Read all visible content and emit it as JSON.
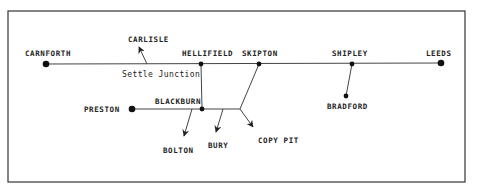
{
  "diagram": {
    "colors": {
      "line": "#444444",
      "frame": "#333333",
      "dot": "#111111",
      "text": "#222222"
    },
    "stations": [
      {
        "id": "carnforth",
        "label": "CARNFORTH",
        "x": 46,
        "y": 64
      },
      {
        "id": "hellifield",
        "label": "HELLIFIELD",
        "x": 201,
        "y": 64
      },
      {
        "id": "skipton",
        "label": "SKIPTON",
        "x": 259,
        "y": 64
      },
      {
        "id": "shipley",
        "label": "SHIPLEY",
        "x": 352,
        "y": 64
      },
      {
        "id": "leeds",
        "label": "LEEDS",
        "x": 441,
        "y": 63
      },
      {
        "id": "preston",
        "label": "PRESTON",
        "x": 132,
        "y": 109
      },
      {
        "id": "blackburn",
        "label": "BLACKBURN",
        "x": 202,
        "y": 109
      },
      {
        "id": "bradford",
        "label": "BRADFORD",
        "x": 346,
        "y": 96
      }
    ],
    "destinations": [
      {
        "id": "carlisle",
        "label": "CARLISLE"
      },
      {
        "id": "bolton",
        "label": "BOLTON"
      },
      {
        "id": "bury",
        "label": "BURY"
      },
      {
        "id": "copy_pit",
        "label": "COPY PIT"
      }
    ],
    "junctions": [
      {
        "id": "settle_junction",
        "label": "Settle Junction"
      }
    ]
  }
}
